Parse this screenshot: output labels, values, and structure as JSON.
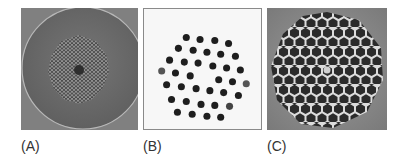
{
  "figure": {
    "panels": [
      {
        "id": "A",
        "label": "(A)",
        "description": "Cross-section of a photonic crystal fiber: circular cladding with a hexagonal lattice of small air holes and a solid central core defect",
        "colors": {
          "background": "#7a7a7a",
          "cladding": "#6e6e6e",
          "cladding_edge": "#b5b5b5",
          "holes": "#3c3c3c",
          "core": "#2e2e2e"
        }
      },
      {
        "id": "B",
        "label": "(B)",
        "description": "Hexagonal arrangement of dark dots (rod lattice) on a light background with a missing center rod",
        "colors": {
          "background": "#f7f7f7",
          "dots": "#1e1e1e",
          "border": "#8a8a8a"
        }
      },
      {
        "id": "C",
        "label": "(C)",
        "description": "Hollow-core style honeycomb of dark hexagonal cells separated by bright thin walls, with a small central defect",
        "colors": {
          "background": "#8c8c8c",
          "cells": "#2a2a2a",
          "walls": "#d9d9d9"
        }
      }
    ]
  }
}
